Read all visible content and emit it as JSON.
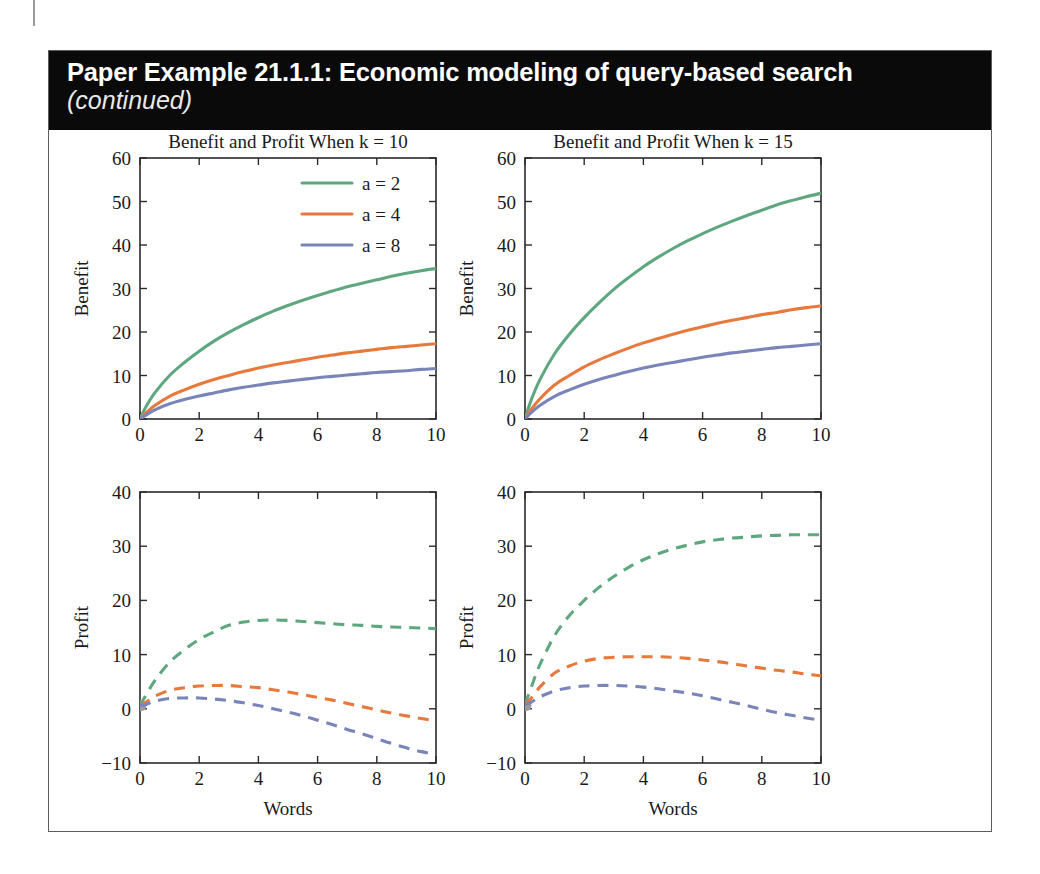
{
  "header": {
    "title": "Paper Example 21.1.1:  Economic modeling of query-based search",
    "subtitle": "(continued)"
  },
  "colors": {
    "green": "#5FA77F",
    "orange": "#E8793C",
    "blue": "#7985B8",
    "axis": "#2b2b2b",
    "banner_bg": "#0a0a0a",
    "banner_text": "#ffffff",
    "frame": "#5c5c5c",
    "origin_marker": "#9a9a9a"
  },
  "legend": {
    "position": "top-right-of-first-panel",
    "entries": [
      {
        "label": "a = 2",
        "color_key": "green"
      },
      {
        "label": "a = 4",
        "color_key": "orange"
      },
      {
        "label": "a = 8",
        "color_key": "blue"
      }
    ]
  },
  "chart_data": [
    {
      "id": "benefit-k10",
      "type": "line",
      "title": "Benefit and Profit When k = 10",
      "xlabel": "",
      "ylabel": "Benefit",
      "xlim": [
        0,
        10
      ],
      "ylim": [
        0,
        60
      ],
      "xticks": [
        0,
        2,
        4,
        6,
        8,
        10
      ],
      "yticks": [
        0,
        10,
        20,
        30,
        40,
        50,
        60
      ],
      "grid": false,
      "linestyle": "solid",
      "x": [
        0,
        0.2,
        0.5,
        1,
        1.5,
        2,
        2.5,
        3,
        3.5,
        4,
        4.5,
        5,
        5.5,
        6,
        6.5,
        7,
        7.5,
        8,
        8.5,
        9,
        9.5,
        10
      ],
      "series": [
        {
          "name": "a = 2",
          "color_key": "green",
          "values": [
            0,
            2.8,
            6.0,
            10.0,
            13.0,
            15.6,
            17.9,
            19.9,
            21.7,
            23.3,
            24.8,
            26.1,
            27.3,
            28.4,
            29.4,
            30.4,
            31.2,
            32.0,
            32.8,
            33.5,
            34.1,
            34.6
          ]
        },
        {
          "name": "a = 4",
          "color_key": "orange",
          "values": [
            0,
            1.4,
            3.1,
            5.2,
            6.7,
            8.0,
            9.1,
            10.0,
            10.9,
            11.7,
            12.4,
            13.0,
            13.6,
            14.2,
            14.7,
            15.2,
            15.6,
            16.0,
            16.4,
            16.7,
            17.0,
            17.3
          ]
        },
        {
          "name": "a = 8",
          "color_key": "blue",
          "values": [
            0,
            0.9,
            2.1,
            3.5,
            4.5,
            5.3,
            6.0,
            6.7,
            7.3,
            7.8,
            8.3,
            8.7,
            9.1,
            9.5,
            9.8,
            10.1,
            10.4,
            10.7,
            10.9,
            11.1,
            11.4,
            11.6
          ]
        }
      ]
    },
    {
      "id": "benefit-k15",
      "type": "line",
      "title": "Benefit and Profit When k = 15",
      "xlabel": "",
      "ylabel": "Benefit",
      "xlim": [
        0,
        10
      ],
      "ylim": [
        0,
        60
      ],
      "xticks": [
        0,
        2,
        4,
        6,
        8,
        10
      ],
      "yticks": [
        0,
        10,
        20,
        30,
        40,
        50,
        60
      ],
      "grid": false,
      "linestyle": "solid",
      "x": [
        0,
        0.2,
        0.5,
        1,
        1.5,
        2,
        2.5,
        3,
        3.5,
        4,
        4.5,
        5,
        5.5,
        6,
        6.5,
        7,
        7.5,
        8,
        8.5,
        9,
        9.5,
        10
      ],
      "series": [
        {
          "name": "a = 2",
          "color_key": "green",
          "values": [
            0,
            4.2,
            9.0,
            15.0,
            19.5,
            23.3,
            26.7,
            29.8,
            32.5,
            35.0,
            37.2,
            39.2,
            41.0,
            42.6,
            44.1,
            45.5,
            46.8,
            48.0,
            49.2,
            50.2,
            51.1,
            51.9
          ]
        },
        {
          "name": "a = 4",
          "color_key": "orange",
          "values": [
            0,
            2.1,
            4.6,
            7.8,
            10.0,
            12.0,
            13.6,
            15.0,
            16.3,
            17.5,
            18.5,
            19.5,
            20.4,
            21.2,
            22.0,
            22.7,
            23.3,
            24.0,
            24.5,
            25.1,
            25.6,
            26.0
          ]
        },
        {
          "name": "a = 8",
          "color_key": "blue",
          "values": [
            0,
            1.4,
            3.1,
            5.2,
            6.7,
            8.0,
            9.1,
            10.0,
            10.9,
            11.7,
            12.4,
            13.0,
            13.6,
            14.2,
            14.7,
            15.2,
            15.6,
            16.0,
            16.4,
            16.7,
            17.0,
            17.3
          ]
        }
      ]
    },
    {
      "id": "profit-k10",
      "type": "line",
      "title": "",
      "xlabel": "Words",
      "ylabel": "Profit",
      "xlim": [
        0,
        10
      ],
      "ylim": [
        -10,
        40
      ],
      "xticks": [
        0,
        2,
        4,
        6,
        8,
        10
      ],
      "yticks": [
        -10,
        0,
        10,
        20,
        30,
        40
      ],
      "ytick_labels": [
        "−10",
        "0",
        "10",
        "20",
        "30",
        "40"
      ],
      "grid": false,
      "linestyle": "dashed",
      "origin_marker": true,
      "x": [
        0,
        0.2,
        0.5,
        1,
        1.5,
        2,
        2.5,
        3,
        3.5,
        4,
        4.5,
        5,
        5.5,
        6,
        6.5,
        7,
        7.5,
        8,
        8.5,
        9,
        9.5,
        10
      ],
      "series": [
        {
          "name": "a = 2",
          "color_key": "green",
          "values": [
            0.6,
            2.5,
            5.2,
            8.6,
            10.9,
            12.8,
            14.2,
            15.4,
            16.0,
            16.3,
            16.4,
            16.3,
            16.1,
            15.9,
            15.7,
            15.5,
            15.4,
            15.2,
            15.1,
            15.0,
            14.9,
            14.8
          ]
        },
        {
          "name": "a = 4",
          "color_key": "orange",
          "values": [
            0.6,
            1.2,
            2.3,
            3.4,
            3.9,
            4.2,
            4.3,
            4.3,
            4.1,
            3.9,
            3.5,
            3.1,
            2.6,
            2.1,
            1.6,
            1.0,
            0.4,
            -0.2,
            -0.8,
            -1.3,
            -1.8,
            -2.2
          ]
        },
        {
          "name": "a = 8",
          "color_key": "blue",
          "values": [
            0.6,
            0.8,
            1.4,
            1.9,
            2.0,
            2.0,
            1.8,
            1.5,
            1.1,
            0.6,
            0.0,
            -0.6,
            -1.3,
            -2.1,
            -2.9,
            -3.8,
            -4.6,
            -5.5,
            -6.4,
            -7.2,
            -7.9,
            -8.4
          ]
        }
      ]
    },
    {
      "id": "profit-k15",
      "type": "line",
      "title": "",
      "xlabel": "Words",
      "ylabel": "Profit",
      "xlim": [
        0,
        10
      ],
      "ylim": [
        -10,
        40
      ],
      "xticks": [
        0,
        2,
        4,
        6,
        8,
        10
      ],
      "yticks": [
        -10,
        0,
        10,
        20,
        30,
        40
      ],
      "ytick_labels": [
        "−10",
        "0",
        "10",
        "20",
        "30",
        "40"
      ],
      "grid": false,
      "linestyle": "dashed",
      "origin_marker": true,
      "x": [
        0,
        0.2,
        0.5,
        1,
        1.5,
        2,
        2.5,
        3,
        3.5,
        4,
        4.5,
        5,
        5.5,
        6,
        6.5,
        7,
        7.5,
        8,
        8.5,
        9,
        9.5,
        10
      ],
      "series": [
        {
          "name": "a = 2",
          "color_key": "green",
          "values": [
            0.8,
            3.8,
            8.1,
            13.5,
            17.2,
            20.0,
            22.4,
            24.4,
            26.1,
            27.5,
            28.6,
            29.5,
            30.2,
            30.8,
            31.2,
            31.5,
            31.7,
            31.9,
            32.0,
            32.1,
            32.1,
            32.1
          ]
        },
        {
          "name": "a = 4",
          "color_key": "orange",
          "values": [
            0.8,
            1.9,
            4.0,
            6.6,
            7.9,
            8.8,
            9.3,
            9.5,
            9.6,
            9.6,
            9.6,
            9.5,
            9.3,
            9.0,
            8.7,
            8.3,
            7.9,
            7.5,
            7.1,
            6.8,
            6.4,
            6.1
          ]
        },
        {
          "name": "a = 8",
          "color_key": "blue",
          "values": [
            0.8,
            1.2,
            2.2,
            3.3,
            3.9,
            4.2,
            4.3,
            4.3,
            4.2,
            4.0,
            3.7,
            3.3,
            2.9,
            2.4,
            1.8,
            1.2,
            0.6,
            -0.1,
            -0.7,
            -1.2,
            -1.7,
            -2.1
          ]
        }
      ]
    }
  ]
}
